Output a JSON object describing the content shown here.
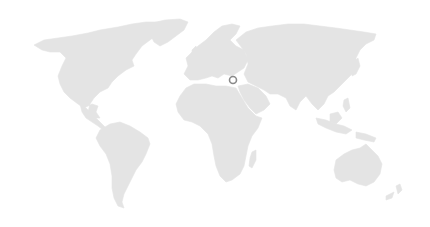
{
  "map": {
    "type": "world-map",
    "land_color": "#e4e4e4",
    "background_color": "#ffffff",
    "marker": {
      "label": "location-marker",
      "x": 233,
      "y": 80,
      "radius": 3.5,
      "stroke_color": "#8a8a8a"
    },
    "regions": [
      "North America",
      "Greenland",
      "South America",
      "Europe",
      "Africa",
      "Asia",
      "Australia",
      "New Zealand"
    ]
  }
}
